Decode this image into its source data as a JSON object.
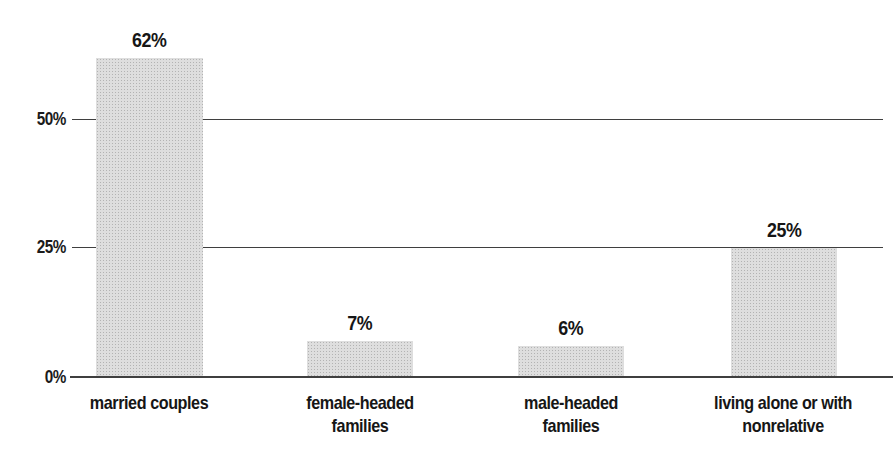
{
  "chart_data": {
    "type": "bar",
    "title": "",
    "xlabel": "",
    "ylabel": "",
    "categories": [
      "married couples",
      "female-headed\nfamilies",
      "male-headed\nfamilies",
      "living alone or with\nnonrelative"
    ],
    "values": [
      62,
      7,
      6,
      25
    ],
    "value_labels": [
      "62%",
      "7%",
      "6%",
      "25%"
    ],
    "yticks": [
      {
        "label": "0%",
        "value": 0
      },
      {
        "label": "25%",
        "value": 25
      },
      {
        "label": "50%",
        "value": 50
      }
    ],
    "ylim": [
      0,
      73
    ],
    "grid": true,
    "legend": "none",
    "bar_color": "#dedede",
    "bar_dot_color": "#b3b3b3",
    "line_color": "#3f3f3f",
    "text_color": "#161616"
  }
}
